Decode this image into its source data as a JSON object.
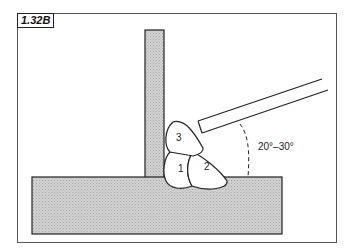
{
  "figure": {
    "label": "1.32B",
    "angle_label": "20°–30°",
    "beads": [
      {
        "number": "1"
      },
      {
        "number": "2"
      },
      {
        "number": "3"
      }
    ],
    "colors": {
      "plate_fill": "#c8c8c8",
      "outline": "#222222",
      "frame": "#555555"
    }
  }
}
